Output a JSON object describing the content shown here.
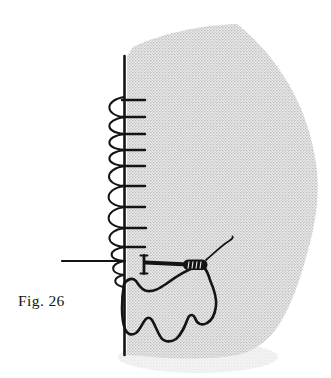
{
  "figure": {
    "label": "Fig. 26"
  },
  "colors": {
    "ink": "#141414",
    "halftone_bg": "#ebebeb",
    "halftone_dot": "#b4b4b4",
    "page_bg": "#ffffff"
  }
}
